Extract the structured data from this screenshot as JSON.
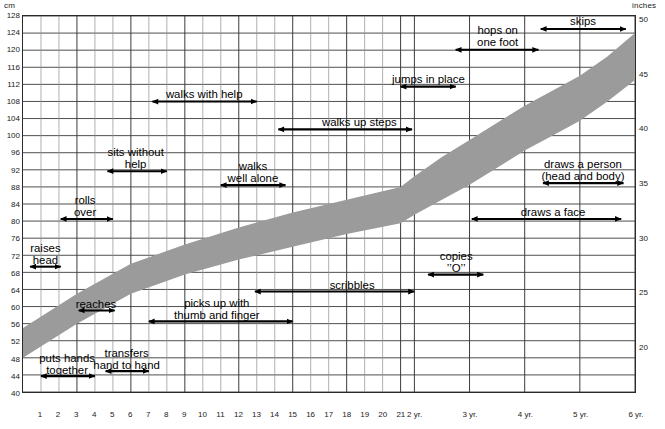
{
  "axes": {
    "cm_caption": "cm",
    "inches_caption": "inches",
    "origin_caption_line1": "month",
    "origin_caption_line2": "of birth",
    "y_left_label": "cm",
    "y_right_label": "inches",
    "y_left_ticks": [
      128,
      124,
      120,
      116,
      112,
      108,
      104,
      100,
      96,
      92,
      88,
      84,
      80,
      76,
      72,
      68,
      64,
      60,
      56,
      52,
      48,
      44,
      40
    ],
    "y_right_ticks": [
      50,
      45,
      40,
      35,
      30,
      25,
      20
    ],
    "y_range_cm": [
      40,
      128
    ],
    "x_ticks": [
      "1",
      "2",
      "3",
      "4",
      "5",
      "6",
      "7",
      "8",
      "9",
      "10",
      "11",
      "12",
      "13",
      "14",
      "15",
      "16",
      "17",
      "18",
      "19",
      "20",
      "21",
      "2 yr.",
      "3 yr.",
      "4 yr.",
      "5 yr.",
      "6 yr."
    ],
    "x_range_months": [
      0,
      72
    ]
  },
  "chart_data": {
    "type": "area",
    "xlabel": "age (months / years from month of birth)",
    "ylabel": "height (cm)",
    "ylim": [
      40,
      128
    ],
    "xlim": [
      0,
      72
    ],
    "grid": true,
    "legend": "none",
    "band_color": "#9b9b9b",
    "series": [
      {
        "name": "height band upper (cm)",
        "x_months": [
          0,
          3,
          6,
          9,
          12,
          15,
          18,
          21,
          24,
          30,
          36,
          42,
          48,
          54,
          60,
          66,
          72
        ],
        "values": [
          55,
          63,
          70,
          74.5,
          78.5,
          82,
          85,
          88,
          90.5,
          95,
          99,
          103,
          107,
          110.5,
          114,
          118.5,
          124
        ]
      },
      {
        "name": "height band lower (cm)",
        "x_months": [
          0,
          3,
          6,
          9,
          12,
          15,
          18,
          21,
          24,
          30,
          36,
          42,
          48,
          54,
          60,
          66,
          72
        ],
        "values": [
          48,
          56,
          63,
          67.5,
          71,
          74,
          77,
          79.5,
          81.5,
          85,
          88.5,
          92.5,
          96.5,
          100,
          103.5,
          108,
          113
        ]
      }
    ],
    "milestones": [
      {
        "name": "raises head",
        "label_lines": [
          "raises",
          "head"
        ],
        "start_months": 0.4,
        "end_months": 2.1,
        "arrow": "double",
        "label_x_months": 1.3,
        "label_top_px": 242
      },
      {
        "name": "puts hands together",
        "label_lines": [
          "puts hands",
          "together"
        ],
        "start_months": 1.0,
        "end_months": 4.0,
        "arrow": "double",
        "label_x_months": 2.5,
        "label_top_px": 352
      },
      {
        "name": "rolls over",
        "label_lines": [
          "rolls",
          "over"
        ],
        "start_months": 2.1,
        "end_months": 5.0,
        "arrow": "double",
        "label_x_months": 3.5,
        "label_top_px": 194
      },
      {
        "name": "reaches",
        "label_lines": [
          "reaches"
        ],
        "start_months": 3.1,
        "end_months": 5.1,
        "arrow": "double",
        "label_x_months": 4.1,
        "label_top_px": 298
      },
      {
        "name": "transfers hand to hand",
        "label_lines": [
          "transfers",
          "hand to hand"
        ],
        "start_months": 4.6,
        "end_months": 7.0,
        "arrow": "double",
        "label_x_months": 5.8,
        "label_top_px": 347
      },
      {
        "name": "sits without help",
        "label_lines": [
          "sits without",
          "help"
        ],
        "start_months": 4.7,
        "end_months": 8.0,
        "arrow": "double",
        "label_x_months": 6.3,
        "label_top_px": 146
      },
      {
        "name": "picks up with thumb and finger",
        "label_lines": [
          "picks up with",
          "thumb and finger"
        ],
        "start_months": 7.0,
        "end_months": 15.0,
        "arrow": "double",
        "label_x_months": 10.8,
        "label_top_px": 297
      },
      {
        "name": "walks with help",
        "label_lines": [
          "walks with help"
        ],
        "start_months": 7.2,
        "end_months": 13.0,
        "arrow": "double",
        "label_x_months": 10.1,
        "label_top_px": 88
      },
      {
        "name": "walks well alone",
        "label_lines": [
          "walks",
          "well alone"
        ],
        "start_months": 11.0,
        "end_months": 14.6,
        "arrow": "double",
        "label_x_months": 12.8,
        "label_top_px": 160
      },
      {
        "name": "scribbles",
        "label_lines": [
          "scribbles"
        ],
        "start_months": 12.9,
        "end_months": 24.0,
        "arrow": "double",
        "label_x_months": 18.3,
        "label_top_px": 279
      },
      {
        "name": "walks up steps",
        "label_lines": [
          "walks up steps"
        ],
        "start_months": 14.2,
        "end_months": 23.5,
        "arrow": "double",
        "label_x_months": 18.7,
        "label_top_px": 116
      },
      {
        "name": "jumps in place",
        "label_lines": [
          "jumps in place"
        ],
        "start_months": 21.0,
        "end_months": 33.0,
        "arrow": "double",
        "label_x_months": 27.0,
        "label_top_px": 73
      },
      {
        "name": "copies O",
        "label_lines": [
          "copies",
          "’’O’’"
        ],
        "start_months": 27.0,
        "end_months": 39.0,
        "arrow": "double",
        "label_x_months": 33.0,
        "label_top_px": 250
      },
      {
        "name": "hops on one foot",
        "label_lines": [
          "hops on",
          "one foot"
        ],
        "start_months": 33.0,
        "end_months": 51.0,
        "arrow": "double",
        "label_x_months": 42.0,
        "label_top_px": 24
      },
      {
        "name": "draws a face",
        "label_lines": [
          "draws a face"
        ],
        "start_months": 36.5,
        "end_months": 69.0,
        "arrow": "double",
        "label_x_months": 54.0,
        "label_top_px": 206
      },
      {
        "name": "draws a person head and body",
        "label_lines": [
          "draws a person",
          "(head and body)"
        ],
        "start_months": 52.0,
        "end_months": 69.5,
        "arrow": "double",
        "label_x_months": 60.5,
        "label_top_px": 158
      },
      {
        "name": "skips",
        "label_lines": [
          "skips"
        ],
        "start_months": 51.5,
        "end_months": 70.0,
        "arrow": "double",
        "label_x_months": 60.5,
        "label_top_px": 15
      }
    ]
  }
}
